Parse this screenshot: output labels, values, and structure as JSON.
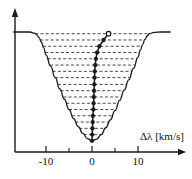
{
  "figure": {
    "axis": {
      "x_label": "Δλ [km/s]",
      "x_tick_labels": [
        "-10",
        "0",
        "10"
      ],
      "x_tick_values": [
        -10,
        0,
        10
      ],
      "x_minor_tick_values": [
        -5,
        5
      ],
      "y_label": ""
    },
    "colors": {
      "line": "#1a1a1a",
      "dash": "#333333",
      "axis": "#1a1a1a",
      "background": "#ffffff"
    }
  },
  "chart_data": {
    "type": "line",
    "xlabel": "Δλ [km/s]",
    "ylabel": "",
    "xlim": [
      -17,
      17
    ],
    "ylim": [
      0,
      1.05
    ],
    "grid": false,
    "legend": "none",
    "series": [
      {
        "name": "line profile",
        "type": "line",
        "x": [
          -17.0,
          -15.0,
          -13.5,
          -12.5,
          -12.0,
          -11.5,
          -11.0,
          -10.5,
          -10.0,
          -9.0,
          -8.0,
          -7.0,
          -6.0,
          -5.0,
          -4.0,
          -3.0,
          -2.0,
          -1.0,
          0.0,
          1.0,
          2.0,
          3.0,
          4.0,
          5.0,
          6.0,
          7.0,
          8.0,
          9.0,
          10.0,
          10.5,
          11.0,
          11.5,
          12.0,
          12.5,
          13.5,
          15.0,
          17.0
        ],
        "y": [
          1.0,
          1.0,
          1.0,
          0.99,
          0.975,
          0.95,
          0.91,
          0.86,
          0.8,
          0.7,
          0.6,
          0.5,
          0.41,
          0.32,
          0.24,
          0.17,
          0.11,
          0.065,
          0.045,
          0.06,
          0.1,
          0.16,
          0.23,
          0.31,
          0.4,
          0.49,
          0.58,
          0.68,
          0.78,
          0.84,
          0.89,
          0.935,
          0.965,
          0.985,
          0.997,
          1.0,
          1.0
        ]
      },
      {
        "name": "bisector chords",
        "type": "hlines",
        "y_levels": [
          0.045,
          0.1,
          0.155,
          0.21,
          0.265,
          0.32,
          0.375,
          0.43,
          0.485,
          0.54,
          0.6,
          0.655,
          0.71,
          0.765,
          0.82,
          0.875,
          0.93,
          0.985
        ],
        "style": "dashed"
      },
      {
        "name": "bisector",
        "type": "line-markers",
        "marker": "filled-circle",
        "x": [
          0.0,
          0.05,
          0.1,
          0.15,
          0.2,
          0.3,
          0.35,
          0.4,
          0.45,
          0.5,
          0.55,
          0.6,
          0.7,
          0.85,
          1.1,
          1.6,
          2.5,
          3.6
        ],
        "y": [
          0.045,
          0.1,
          0.155,
          0.21,
          0.265,
          0.32,
          0.375,
          0.43,
          0.485,
          0.54,
          0.6,
          0.655,
          0.71,
          0.765,
          0.82,
          0.875,
          0.93,
          0.985
        ]
      }
    ]
  }
}
